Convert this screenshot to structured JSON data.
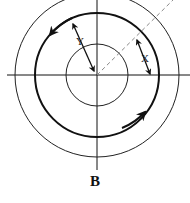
{
  "diagram": {
    "caption": "B",
    "labels": {
      "x": "X",
      "y": "Y"
    },
    "circles": [
      {
        "name": "outer",
        "radius": 82,
        "style": "thin"
      },
      {
        "name": "middle",
        "radius": 62,
        "style": "thick"
      },
      {
        "name": "inner",
        "radius": 31,
        "style": "thin"
      }
    ],
    "colors": {
      "stroke": "#111111",
      "dashed": "#888888",
      "background": "#ffffff"
    }
  }
}
